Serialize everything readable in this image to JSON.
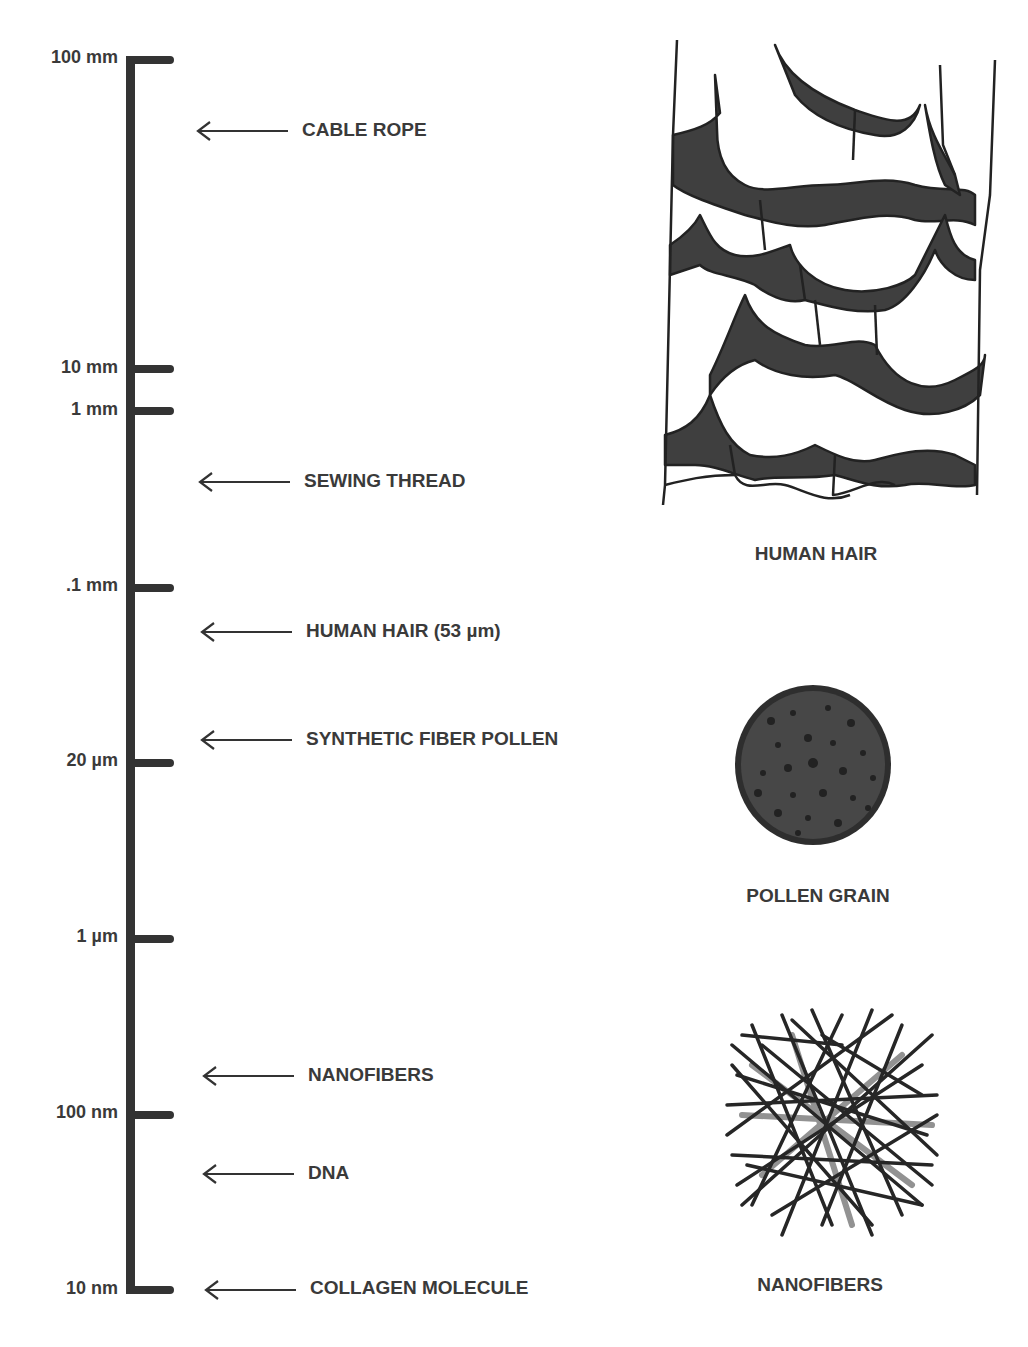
{
  "scale": {
    "ticks": [
      {
        "label": "100 mm",
        "y": 60
      },
      {
        "label": "10 mm",
        "y": 369
      },
      {
        "label": "1 mm",
        "y": 411
      },
      {
        "label": ".1 mm",
        "y": 588
      },
      {
        "label": "20 µm",
        "y": 763
      },
      {
        "label": "1 µm",
        "y": 939
      },
      {
        "label": "100 nm",
        "y": 1115
      },
      {
        "label": "10 nm",
        "y": 1291
      }
    ]
  },
  "items": [
    {
      "label": "CABLE ROPE",
      "y": 131
    },
    {
      "label": "SEWING THREAD",
      "y": 482
    },
    {
      "label": "HUMAN HAIR (53 µm)",
      "y": 632
    },
    {
      "label": "SYNTHETIC FIBER POLLEN",
      "y": 740
    },
    {
      "label": "NANOFIBERS",
      "y": 1076
    },
    {
      "label": "DNA",
      "y": 1174
    },
    {
      "label": "COLLAGEN MOLECULE",
      "y": 1289
    }
  ],
  "illustrations": [
    {
      "name": "human-hair",
      "caption": "HUMAN HAIR"
    },
    {
      "name": "pollen-grain",
      "caption": "POLLEN GRAIN"
    },
    {
      "name": "nanofibers",
      "caption": "NANOFIBERS"
    }
  ],
  "colors": {
    "ink": "#333333",
    "fill": "#3f3f3f",
    "paper": "#ffffff"
  }
}
